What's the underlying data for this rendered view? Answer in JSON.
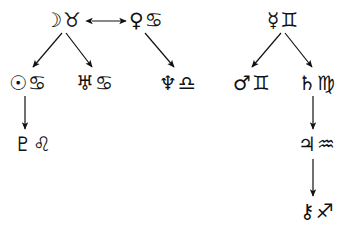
{
  "diagram": {
    "background_color": "#ffffff",
    "stroke_color": "#111111",
    "width": 347,
    "height": 233,
    "nodes": [
      {
        "id": "moon-taurus",
        "planet_name": "moon",
        "planet_glyph": "☽",
        "sign_name": "taurus",
        "sign_glyph": "♉",
        "label": "☽♉"
      },
      {
        "id": "venus-cancer",
        "planet_name": "venus",
        "planet_glyph": "♀",
        "sign_name": "cancer",
        "sign_glyph": "♋",
        "label": "♀♋"
      },
      {
        "id": "mercury-gemini",
        "planet_name": "mercury",
        "planet_glyph": "☿",
        "sign_name": "gemini",
        "sign_glyph": "♊",
        "label": "☿♊"
      },
      {
        "id": "sun-cancer",
        "planet_name": "sun",
        "planet_glyph": "☉",
        "sign_name": "cancer",
        "sign_glyph": "♋",
        "label": "☉♋"
      },
      {
        "id": "uranus-cancer",
        "planet_name": "uranus",
        "planet_glyph": "♅",
        "sign_name": "cancer",
        "sign_glyph": "♋",
        "label": "♅♋"
      },
      {
        "id": "neptune-libra",
        "planet_name": "neptune",
        "planet_glyph": "♆",
        "sign_name": "libra",
        "sign_glyph": "♎",
        "label": "♆♎"
      },
      {
        "id": "mars-gemini",
        "planet_name": "mars",
        "planet_glyph": "♂",
        "sign_name": "gemini",
        "sign_glyph": "♊",
        "label": "♂♊"
      },
      {
        "id": "saturn-virgo",
        "planet_name": "saturn",
        "planet_glyph": "♄",
        "sign_name": "virgo",
        "sign_glyph": "♍",
        "label": "♄♍"
      },
      {
        "id": "pluto-leo",
        "planet_name": "pluto",
        "planet_glyph": "♇",
        "sign_name": "leo",
        "sign_glyph": "♌",
        "label": "♇♌"
      },
      {
        "id": "jupiter-aquarius",
        "planet_name": "jupiter",
        "planet_glyph": "♃",
        "sign_name": "aquarius",
        "sign_glyph": "♒",
        "label": "♃♒"
      },
      {
        "id": "chiron-sagittarius",
        "planet_name": "chiron",
        "planet_glyph": "⚷",
        "sign_name": "sagittarius",
        "sign_glyph": "♐",
        "label": "⚷♐"
      }
    ],
    "edges": [
      {
        "id": "moon-taurus--venus-cancer",
        "from": "moon-taurus",
        "to": "venus-cancer",
        "style": "double-headed-horizontal"
      },
      {
        "id": "moon-taurus--sun-cancer",
        "from": "moon-taurus",
        "to": "sun-cancer",
        "style": "single-headed-diagonal"
      },
      {
        "id": "moon-taurus--uranus-cancer",
        "from": "moon-taurus",
        "to": "uranus-cancer",
        "style": "single-headed-diagonal"
      },
      {
        "id": "venus-cancer--neptune-libra",
        "from": "venus-cancer",
        "to": "neptune-libra",
        "style": "single-headed-diagonal"
      },
      {
        "id": "sun-cancer--pluto-leo",
        "from": "sun-cancer",
        "to": "pluto-leo",
        "style": "single-headed-vertical"
      },
      {
        "id": "mercury-gemini--mars-gemini",
        "from": "mercury-gemini",
        "to": "mars-gemini",
        "style": "single-headed-diagonal"
      },
      {
        "id": "mercury-gemini--saturn-virgo",
        "from": "mercury-gemini",
        "to": "saturn-virgo",
        "style": "single-headed-diagonal"
      },
      {
        "id": "saturn-virgo--jupiter-aquarius",
        "from": "saturn-virgo",
        "to": "jupiter-aquarius",
        "style": "single-headed-vertical"
      },
      {
        "id": "jupiter-aquarius--chiron-sagit",
        "from": "jupiter-aquarius",
        "to": "chiron-sagittarius",
        "style": "single-headed-vertical"
      }
    ]
  }
}
